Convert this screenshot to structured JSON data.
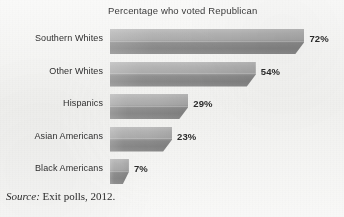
{
  "chart_data": {
    "type": "bar",
    "orientation": "horizontal",
    "title": "Percentage who voted Republican",
    "xlabel": "",
    "ylabel": "",
    "xlim": [
      0,
      80
    ],
    "grid": false,
    "legend": null,
    "units": "percent",
    "categories": [
      "Southern Whites",
      "Other Whites",
      "Hispanics",
      "Asian Americans",
      "Black Americans"
    ],
    "values": [
      72,
      54,
      29,
      23,
      7
    ],
    "value_labels": [
      "72%",
      "54%",
      "29%",
      "23%",
      "7%"
    ],
    "bar_color": "#a0a0a0",
    "bar_color_top": "#bdbdbd",
    "bar_color_bottom": "#848484",
    "source_prefix": "Source:",
    "source_text": "Exit polls, 2012."
  },
  "figure": {
    "background_color": "#f3f3f1",
    "text_color": "#2f2f2f"
  }
}
